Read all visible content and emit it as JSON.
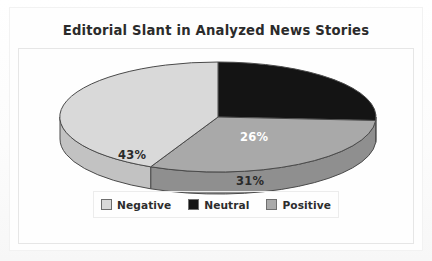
{
  "chart_data": {
    "type": "pie",
    "title": "Editorial Slant in Analyzed News Stories",
    "categories": [
      "Neutral",
      "Positive",
      "Negative"
    ],
    "values": [
      26,
      31,
      43
    ],
    "value_labels": [
      "26%",
      "31%",
      "43%"
    ],
    "unit": "percent",
    "legend": {
      "position": "bottom",
      "entries": [
        {
          "label": "Negative",
          "color": "#d9d9d9",
          "value": 43,
          "value_label": "43%"
        },
        {
          "label": "Neutral",
          "color": "#141414",
          "value": 26,
          "value_label": "26%"
        },
        {
          "label": "Positive",
          "color": "#a9a9a9",
          "value": 31,
          "value_label": "31%"
        }
      ]
    },
    "start_angle_deg": 0,
    "direction": "clockwise",
    "three_d": true,
    "grid": false,
    "xlabel": "",
    "ylabel": ""
  },
  "chart": {
    "title": "Editorial Slant in Analyzed News Stories",
    "slices": {
      "neutral_pct": "26%",
      "positive_pct": "31%",
      "negative_pct": "43%"
    }
  },
  "legend": {
    "items": [
      {
        "label": "Negative"
      },
      {
        "label": "Neutral"
      },
      {
        "label": "Positive"
      }
    ]
  },
  "colors": {
    "negative": "#d9d9d9",
    "negative_side": "#c2c2c2",
    "neutral": "#141414",
    "neutral_side": "#0d0d0d",
    "positive": "#a9a9a9",
    "positive_side": "#8f8f8f",
    "outline": "#4a4a4a",
    "title_text": "#2b2b2b",
    "label_dark": "#2a2a2a",
    "label_light": "#ffffff",
    "frame": "#e6e6e6",
    "background": "#fefefe"
  }
}
